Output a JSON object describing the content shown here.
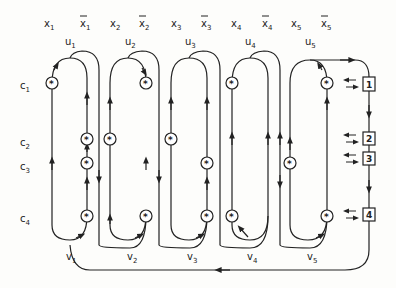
{
  "diagram": {
    "type": "reduction-gadget-diagram",
    "variables": [
      {
        "pos": "x",
        "neg": "x",
        "index": "1",
        "u": "u",
        "v": "v"
      },
      {
        "pos": "x",
        "neg": "x",
        "index": "2",
        "u": "u",
        "v": "v"
      },
      {
        "pos": "x",
        "neg": "x",
        "index": "3",
        "u": "u",
        "v": "v"
      },
      {
        "pos": "x",
        "neg": "x",
        "index": "4",
        "u": "u",
        "v": "v"
      },
      {
        "pos": "x",
        "neg": "x",
        "index": "5",
        "u": "u",
        "v": "v"
      }
    ],
    "clauses": [
      {
        "label": "c",
        "index": "1"
      },
      {
        "label": "c",
        "index": "2"
      },
      {
        "label": "c",
        "index": "3"
      },
      {
        "label": "c",
        "index": "4"
      }
    ],
    "clause_boxes": [
      "1",
      "2",
      "3",
      "4"
    ],
    "node_symbol": "*"
  }
}
